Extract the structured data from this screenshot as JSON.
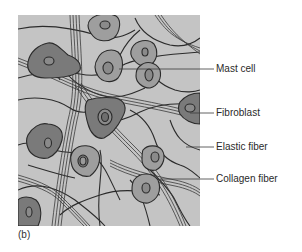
{
  "figure": {
    "panel_label": "(b)",
    "background_color": "#c4c4c4",
    "colors": {
      "fibroblast_fill": "#7a7a7a",
      "mast_cell_fill": "#9e9e9e",
      "nucleus_fill": "#8a8a8a",
      "fiber_stroke": "#2b2b2b"
    },
    "labels": [
      {
        "id": "mast-cell",
        "text": "Mast cell"
      },
      {
        "id": "fibroblast",
        "text": "Fibroblast"
      },
      {
        "id": "elastic-fiber",
        "text": "Elastic fiber"
      },
      {
        "id": "collagen-fiber",
        "text": "Collagen fiber"
      }
    ]
  }
}
